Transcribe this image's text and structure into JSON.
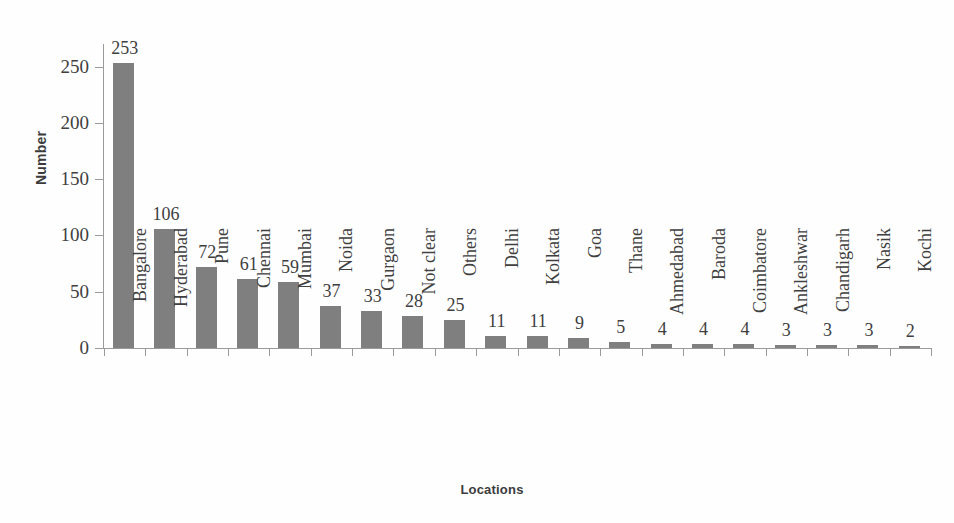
{
  "chart_data": {
    "type": "bar",
    "title": "",
    "xlabel": "Locations",
    "ylabel": "Number",
    "categories": [
      "Bangalore",
      "Hyderabad",
      "Pune",
      "Chennai",
      "Mumbai",
      "Noida",
      "Gurgaon",
      "Not clear",
      "Others",
      "Delhi",
      "Kolkata",
      "Goa",
      "Thane",
      "Ahmedabad",
      "Baroda",
      "Coimbatore",
      "Ankleshwar",
      "Chandigarh",
      "Nasik",
      "Kochi"
    ],
    "values": [
      253,
      106,
      72,
      61,
      59,
      37,
      33,
      28,
      25,
      11,
      11,
      9,
      5,
      4,
      4,
      4,
      3,
      3,
      3,
      2
    ],
    "ylim": [
      0,
      270
    ],
    "yticks": [
      0,
      50,
      100,
      150,
      200,
      250
    ],
    "ytick_labels": [
      "0",
      "50",
      "100",
      "150",
      "200",
      "250"
    ],
    "grid": false,
    "legend": false,
    "bar_color": "#7f7f7f",
    "axis_color": "#9a9a9a",
    "text_color": "#3f3f3f",
    "background_color": "#fefefe"
  }
}
